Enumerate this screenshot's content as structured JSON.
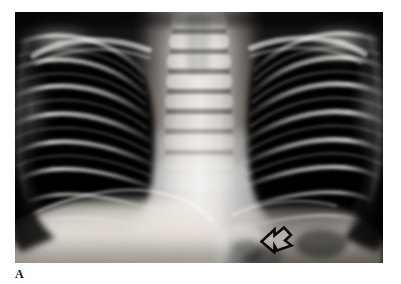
{
  "figure": {
    "panel_label": "A",
    "modality": "chest-radiograph",
    "view": "frontal",
    "background_color": "#ffffff",
    "film_background_color": "#050505"
  },
  "radiograph": {
    "frame": {
      "x": 15,
      "y": 12,
      "width": 368,
      "height": 251
    },
    "regions": [
      {
        "name": "right-lung-field",
        "tone": "radiolucent-dark"
      },
      {
        "name": "left-lung-field",
        "tone": "radiolucent-dark"
      },
      {
        "name": "mediastinum-spine-column",
        "tone": "radiopaque-bright"
      },
      {
        "name": "right-hemidiaphragm",
        "tone": "radiopaque-bright"
      },
      {
        "name": "left-hemidiaphragm",
        "tone": "radiopaque-bright"
      },
      {
        "name": "right-costophrenic-angle",
        "tone": "radiolucent-dark"
      },
      {
        "name": "left-costophrenic-angle",
        "tone": "radiolucent-dark"
      },
      {
        "name": "clavicles",
        "tone": "radiopaque-bright"
      },
      {
        "name": "rib-cage",
        "tone": "radiopaque-bright"
      },
      {
        "name": "cervical-thoracic-vertebrae",
        "tone": "radiopaque-bright"
      }
    ]
  },
  "annotation": {
    "arrow": {
      "label": "open-arrow",
      "direction": "left-up",
      "style": "outline",
      "stroke_color": "#0d0d0d",
      "fill_color": "#d7d3cc",
      "x": 245,
      "y": 212,
      "width": 36,
      "height": 30,
      "points_to": "left-retrocardiac-lucency"
    }
  }
}
